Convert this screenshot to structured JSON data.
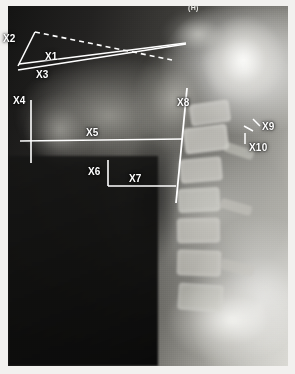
{
  "image": {
    "kind": "lateral-cervical-spine-radiograph",
    "orientation_marker": "(H)",
    "modality_note": "plain film lateral view"
  },
  "annotations": {
    "title": "Cephalometric measurement overlay",
    "labels": [
      {
        "id": "X1",
        "text": "X1"
      },
      {
        "id": "X2",
        "text": "X2"
      },
      {
        "id": "X3",
        "text": "X3"
      },
      {
        "id": "X4",
        "text": "X4"
      },
      {
        "id": "X5",
        "text": "X5"
      },
      {
        "id": "X6",
        "text": "X6"
      },
      {
        "id": "X7",
        "text": "X7"
      },
      {
        "id": "X8",
        "text": "X8"
      },
      {
        "id": "X9",
        "text": "X9"
      },
      {
        "id": "X10",
        "text": "X10"
      }
    ],
    "line_color": "#ffffff",
    "label_color": "#ffffff"
  },
  "colors": {
    "page_background": "#ffffff",
    "film_dark": "#141413",
    "film_bright": "#f6f6f3",
    "overlay": "#ffffff"
  }
}
